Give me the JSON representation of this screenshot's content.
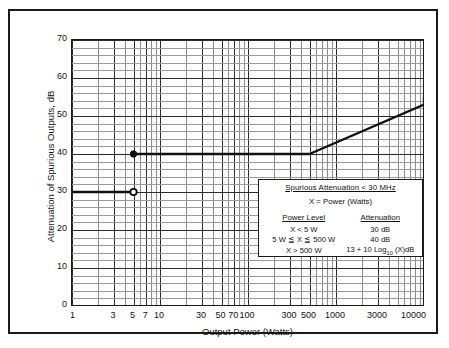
{
  "chart_data": {
    "type": "line",
    "title": "",
    "xlabel": "Output Power (Watts)",
    "ylabel": "Attenuation of Spurious Outputs, dB",
    "xscale": "log",
    "xlim": [
      1,
      10000
    ],
    "ylim": [
      0,
      70
    ],
    "grid": true,
    "legend_position": "inside-lower-right",
    "y_ticks": [
      0,
      10,
      20,
      30,
      40,
      50,
      60,
      70
    ],
    "y_minor_step": 2,
    "x_ticks": [
      1,
      3,
      5,
      7,
      10,
      30,
      50,
      70,
      100,
      300,
      500,
      1000,
      3000,
      10000
    ],
    "x_tick_labels": [
      "1",
      "3",
      "5",
      "7",
      "10",
      "30",
      "50",
      "70",
      "100",
      "300",
      "500",
      "1000",
      "3000",
      "10000"
    ],
    "series": [
      {
        "name": "X < 5 W  (30 dB)",
        "points": [
          [
            1,
            30
          ],
          [
            5,
            30
          ]
        ],
        "style": "solid",
        "width": 2.4,
        "color": "#111111",
        "end_marker": "open-circle"
      },
      {
        "name": "5 W <= X <= 500 W  (40 dB)",
        "points": [
          [
            5,
            40
          ],
          [
            500,
            40
          ]
        ],
        "style": "solid",
        "width": 2.4,
        "color": "#111111",
        "start_marker": "filled-circle"
      },
      {
        "name": "X > 500 W  (13 + 10 Log10(X) dB)",
        "points": [
          [
            500,
            40
          ],
          [
            10000,
            53
          ],
          [
            10000,
            55
          ]
        ],
        "style": "solid",
        "width": 2.4,
        "color": "#111111"
      }
    ],
    "markers": [
      {
        "x": 5,
        "y": 40,
        "type": "filled-circle"
      },
      {
        "x": 5,
        "y": 30,
        "type": "open-circle"
      }
    ],
    "annotations": []
  },
  "legend": {
    "title": "Spurious Attenuation  < 30 MHz",
    "subtitle": "X = Power (Watts)",
    "columns": [
      "Power Level",
      "Attenuation"
    ],
    "rows": [
      {
        "level": "X < 5 W",
        "attenuation": "30 dB"
      },
      {
        "level": "5 W ≦ X ≦ 500 W",
        "attenuation": "40 dB"
      },
      {
        "level": "X > 500 W",
        "attenuation_prefix": "13 + 10 Log",
        "attenuation_sub": "10",
        "attenuation_suffix": " (X)dB"
      }
    ]
  },
  "axes": {
    "x_title": "Output Power (Watts)",
    "y_title": "Attenuation of Spurious Outputs, dB",
    "y_labels": [
      "70",
      "60",
      "50",
      "40",
      "30",
      "20",
      "10",
      "0"
    ],
    "x_labels": [
      "1",
      "3",
      "5",
      "7",
      "10",
      "30",
      "50",
      "70",
      "100",
      "300",
      "500",
      "1000",
      "3000",
      "10000"
    ]
  },
  "colors": {
    "line": "#111111",
    "grid_major": "#2b2b2b",
    "grid_minor": "#9a9a9a",
    "frame": "#1a1a1a",
    "background": "#ffffff"
  }
}
